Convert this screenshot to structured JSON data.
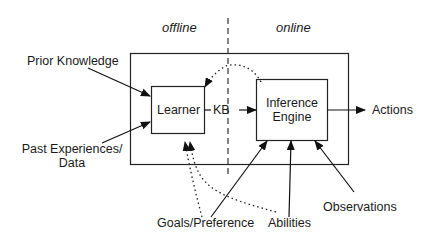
{
  "diagram": {
    "phases": {
      "offline": "offline",
      "online": "online"
    },
    "nodes": {
      "learner": "Learner",
      "inference_engine_line1": "Inference",
      "inference_engine_line2": "Engine",
      "kb": "KB"
    },
    "inputs": {
      "prior_knowledge": "Prior Knowledge",
      "past_experiences_line1": "Past Experiences/",
      "past_experiences_line2": "Data",
      "goals_preference": "Goals/Preference",
      "abilities": "Abilities",
      "observations": "Observations"
    },
    "outputs": {
      "actions": "Actions"
    },
    "edges": [
      {
        "from": "Prior Knowledge",
        "to": "Learner",
        "style": "solid"
      },
      {
        "from": "Past Experiences/Data",
        "to": "Learner",
        "style": "solid"
      },
      {
        "from": "Learner",
        "to": "KB",
        "style": "solid"
      },
      {
        "from": "KB",
        "to": "Inference Engine",
        "style": "solid"
      },
      {
        "from": "Inference Engine",
        "to": "Actions",
        "style": "solid"
      },
      {
        "from": "Inference Engine",
        "to": "Learner",
        "style": "dotted"
      },
      {
        "from": "Goals/Preference",
        "to": "Inference Engine",
        "style": "solid"
      },
      {
        "from": "Goals/Preference",
        "to": "Learner",
        "style": "dotted"
      },
      {
        "from": "Abilities",
        "to": "Inference Engine",
        "style": "solid"
      },
      {
        "from": "Abilities",
        "to": "Learner",
        "style": "dotted"
      },
      {
        "from": "Observations",
        "to": "Inference Engine",
        "style": "solid"
      }
    ]
  }
}
